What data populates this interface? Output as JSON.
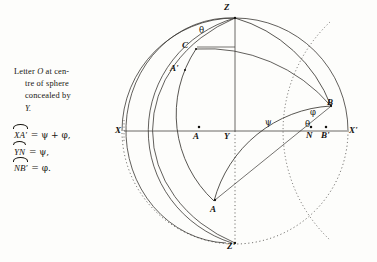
{
  "caption": {
    "line1_pre": "Letter ",
    "line1_italic": "O",
    "line1_post": " at cen-",
    "line2": "tre of sphere",
    "line3": "concealed by",
    "line4": "Y."
  },
  "equations": [
    {
      "arc": "XA'",
      "rhs": " = ψ + φ,"
    },
    {
      "arc": "YN",
      "rhs": " = ψ,"
    },
    {
      "arc": "NB'",
      "rhs": " = φ."
    }
  ],
  "diagram": {
    "labels": [
      {
        "name": "point-label-z",
        "text": "Z",
        "x": 224,
        "y": 3
      },
      {
        "name": "point-label-c",
        "text": "C",
        "x": 182,
        "y": 41
      },
      {
        "name": "point-label-a-prime",
        "text": "A'",
        "x": 170,
        "y": 64
      },
      {
        "name": "point-label-b",
        "text": "B",
        "x": 327,
        "y": 98
      },
      {
        "name": "point-label-x",
        "text": "X",
        "x": 115,
        "y": 130
      },
      {
        "name": "point-label-a",
        "text": "A",
        "x": 193,
        "y": 133
      },
      {
        "name": "point-label-y",
        "text": "Y",
        "x": 224,
        "y": 133
      },
      {
        "name": "point-label-n",
        "text": "N",
        "x": 307,
        "y": 131
      },
      {
        "name": "point-label-b-prime",
        "text": "B'",
        "x": 322,
        "y": 131
      },
      {
        "name": "point-label-x-prime",
        "text": "X'",
        "x": 350,
        "y": 128
      },
      {
        "name": "point-label-a-lower",
        "text": "A",
        "x": 210,
        "y": 205
      },
      {
        "name": "point-label-z-prime",
        "text": "Z'",
        "x": 227,
        "y": 242
      }
    ],
    "angles": [
      {
        "name": "angle-label-theta-top",
        "text": "θ",
        "x": 199,
        "y": 26
      },
      {
        "name": "angle-label-psi-axis",
        "text": "ψ",
        "x": 265,
        "y": 118
      },
      {
        "name": "angle-label-phi-right",
        "text": "φ",
        "x": 310,
        "y": 110
      },
      {
        "name": "angle-label-theta-right",
        "text": "θ",
        "x": 306,
        "y": 122
      }
    ],
    "colors": {
      "ink": "#141310",
      "line": "#3a3733",
      "paper": "#fdfdfb"
    }
  }
}
